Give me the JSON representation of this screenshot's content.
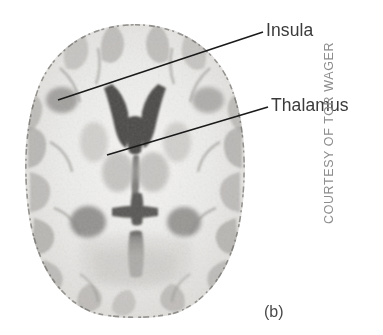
{
  "figure": {
    "type": "axial-mri-brain-slice",
    "panel_letter": "(b)",
    "credit": "COURTESY OF TOR WAGER",
    "background_color": "#ffffff"
  },
  "annotations": [
    {
      "id": "insula",
      "label": "Insula",
      "leader_from": [
        58,
        100
      ],
      "leader_to": [
        263,
        32
      ],
      "line_color": "#1a1a1a",
      "text_color": "#3a3a3a"
    },
    {
      "id": "thalamus",
      "label": "Thalamus",
      "leader_from": [
        107,
        155
      ],
      "leader_to": [
        268,
        107
      ],
      "line_color": "#1a1a1a",
      "text_color": "#3a3a3a"
    }
  ],
  "brain": {
    "modality": "MRI",
    "plane": "axial",
    "colormap": "grayscale",
    "bounds_px": {
      "left": 22,
      "top": 25,
      "right": 248,
      "bottom": 318
    },
    "tissue_light": "#f2f1ef",
    "tissue_mid": "#c9c8c5",
    "tissue_dark": "#8e8d8b",
    "ventricle_color": "#4a4a4a",
    "structures": [
      "lateral-ventricles",
      "third-ventricle",
      "thalamus",
      "insula",
      "cortical-gyri",
      "posterior-horns"
    ]
  }
}
